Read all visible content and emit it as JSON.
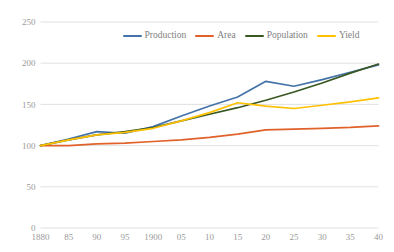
{
  "chart_data": {
    "type": "line",
    "title": "",
    "xlabel": "",
    "ylabel": "",
    "ylim": [
      0,
      250
    ],
    "grid": true,
    "legend_position": "top-center",
    "x": [
      1880,
      1885,
      1890,
      1895,
      1900,
      1905,
      1910,
      1915,
      1920,
      1925,
      1930,
      1935,
      1940
    ],
    "categories": [
      "1880",
      "85",
      "90",
      "95",
      "1900",
      "05",
      "10",
      "15",
      "20",
      "25",
      "30",
      "35",
      "40"
    ],
    "yticks": [
      "0",
      "50",
      "100",
      "150",
      "200",
      "250"
    ],
    "ytick_values": [
      0,
      50,
      100,
      150,
      200,
      250
    ],
    "series": [
      {
        "name": "Production",
        "color": "#4472a8",
        "values": [
          100,
          108,
          117,
          115,
          123,
          136,
          148,
          159,
          178,
          172,
          180,
          189,
          198
        ]
      },
      {
        "name": "Area",
        "color": "#e0622a",
        "values": [
          100,
          100,
          102,
          103,
          105,
          107,
          110,
          114,
          119,
          120,
          121,
          122,
          124
        ]
      },
      {
        "name": "Population",
        "color": "#385723",
        "values": [
          100,
          107,
          113,
          117,
          122,
          130,
          138,
          146,
          155,
          165,
          176,
          188,
          199
        ]
      },
      {
        "name": "Yield",
        "color": "#ffc000",
        "values": [
          100,
          107,
          113,
          116,
          121,
          130,
          140,
          152,
          148,
          145,
          149,
          153,
          158
        ]
      }
    ]
  },
  "legend": {
    "items": [
      {
        "label": "Production",
        "color": "#4472a8"
      },
      {
        "label": "Area",
        "color": "#e0622a"
      },
      {
        "label": "Population",
        "color": "#385723"
      },
      {
        "label": "Yield",
        "color": "#ffc000"
      }
    ]
  }
}
